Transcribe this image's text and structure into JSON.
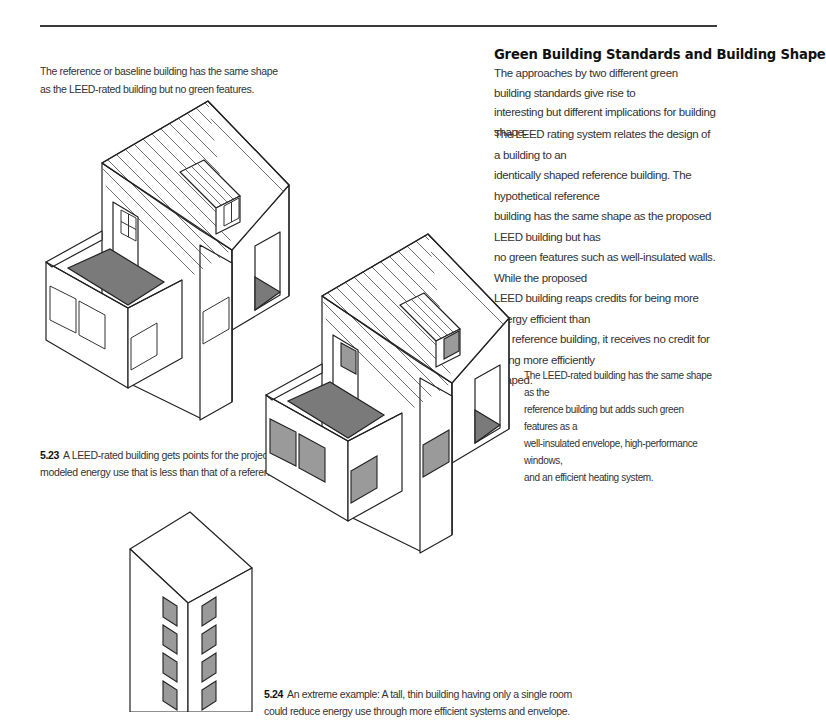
{
  "page": {
    "section_heading": "Green Building Standards and Building Shape",
    "intro_paragraph": [
      "The approaches by two different green building standards give rise to",
      "interesting but different implications for building shape."
    ],
    "body_paragraph": [
      "The LEED rating system relates the design of a building to an",
      "identically shaped reference building. The hypothetical reference",
      "building has the same shape as the proposed LEED building but has",
      "no green features such as well-insulated walls. While the proposed",
      "LEED building reaps credits for being more energy efficient than",
      "the reference building, it receives no credit for being more efficiently",
      "shaped."
    ]
  },
  "annotations": {
    "reference_building": [
      "The reference or baseline building has the same shape",
      "as the LEED-rated building but no green features."
    ],
    "leed_building": [
      "The LEED-rated building has the same shape as the",
      "reference building but adds such green features as a",
      "well-insulated envelope, high-performance windows,",
      "and an efficient heating system."
    ]
  },
  "figures": {
    "fig_5_23": {
      "number": "5.23",
      "caption_line1": "A LEED-rated building gets points for the projected or",
      "caption_line2": "modeled energy use that is less than that of a reference building."
    },
    "fig_5_24": {
      "number": "5.24",
      "caption_line1": "An extreme example: A tall, thin building having only a single room",
      "caption_line2": "could reduce energy use through more efficient systems and envelope."
    }
  },
  "colors": {
    "shade": "#7a7a7a",
    "window_fill_green": "#9a9a9a",
    "line": "#222222"
  }
}
